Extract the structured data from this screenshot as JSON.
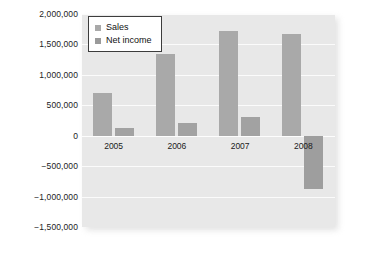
{
  "chart_data": {
    "type": "bar",
    "title": "",
    "xlabel": "",
    "ylabel": "",
    "categories": [
      "2005",
      "2006",
      "2007",
      "2008"
    ],
    "series": [
      {
        "name": "Sales",
        "values": [
          710000,
          1350000,
          1720000,
          1670000
        ],
        "color": "#a9a9a9"
      },
      {
        "name": "Net income",
        "values": [
          130000,
          210000,
          310000,
          -880000
        ],
        "color": "#9e9e9e"
      }
    ],
    "ylim": [
      -1500000,
      2000000
    ],
    "ytick_values": [
      2000000,
      1500000,
      1000000,
      500000,
      0,
      -500000,
      -1000000,
      -1500000
    ],
    "ytick_labels": [
      "2,000,000",
      "1,500,000",
      "1,000,000",
      "500,000",
      "0",
      "−500,000",
      "−1,000,000",
      "−1,500,000"
    ],
    "grid": true,
    "legend_position": "top-left",
    "plot_background": "#e8e8e8",
    "gridline_color": "#fbfbfb"
  },
  "legend": {
    "items": [
      {
        "label": "Sales",
        "swatch": "legend-swatch-sales"
      },
      {
        "label": "Net income",
        "swatch": "legend-swatch-net-income"
      }
    ]
  }
}
